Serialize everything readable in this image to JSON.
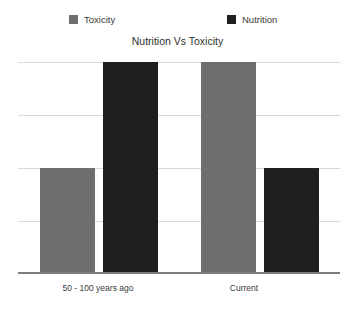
{
  "chart_data": {
    "type": "bar",
    "title": "Nutrition Vs Toxicity",
    "xlabel": "",
    "ylabel": "",
    "categories": [
      "50 - 100 years ago",
      "Current"
    ],
    "series": [
      {
        "name": "Toxicity",
        "color": "#6e6e6e",
        "values": [
          2,
          4
        ]
      },
      {
        "name": "Nutrition",
        "color": "#1f1f1f",
        "values": [
          4,
          2
        ]
      }
    ],
    "ylim": [
      0,
      4
    ],
    "y_gridline_values": [
      4,
      3,
      2,
      1,
      0
    ],
    "grid": true,
    "y_tick_labels_visible": false,
    "legend_position": "top",
    "axis_line_color": "#7d7d7d",
    "gridline_color": "#d9d9d9",
    "background_color": "#ffffff"
  },
  "legend": {
    "entries": [
      {
        "label": "Toxicity",
        "color": "#6e6e6e"
      },
      {
        "label": "Nutrition",
        "color": "#1f1f1f"
      }
    ]
  },
  "axis": {
    "category_labels": [
      "50 - 100 years ago",
      "Current"
    ]
  }
}
